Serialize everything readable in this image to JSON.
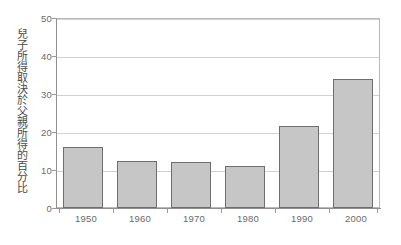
{
  "chart_data": {
    "type": "bar",
    "title": "",
    "subtitle": "",
    "xlabel": "",
    "ylabel": "兒子所得取決於父親所得的百分比",
    "categories": [
      "1950",
      "1960",
      "1970",
      "1980",
      "1990",
      "2000"
    ],
    "values": [
      16,
      12.5,
      12,
      11,
      21.5,
      34
    ],
    "series": [
      {
        "name": "兒子所得取決於父親所得的百分比",
        "values": [
          16,
          12.5,
          12,
          11,
          21.5,
          34
        ]
      }
    ],
    "ylim": [
      0,
      50
    ],
    "yticks": [
      0,
      10,
      20,
      30,
      40,
      50
    ],
    "ytick_labels": [
      "0",
      "10",
      "20",
      "30",
      "40",
      "50"
    ],
    "xtick_labels": [
      "1950",
      "1960",
      "1970",
      "1980",
      "1990",
      "2000"
    ],
    "grid": "horizontal",
    "legend": "none",
    "legend_position": "none",
    "annotations": [],
    "colors": {
      "bar_fill": "#c6c6c6",
      "bar_border": "#6e6e6e",
      "gridline": "#d2d2d2",
      "frame": "#b9b9b9",
      "axis": "#8f8f8f",
      "text": "#6a6a6a",
      "background": "#ffffff"
    }
  }
}
